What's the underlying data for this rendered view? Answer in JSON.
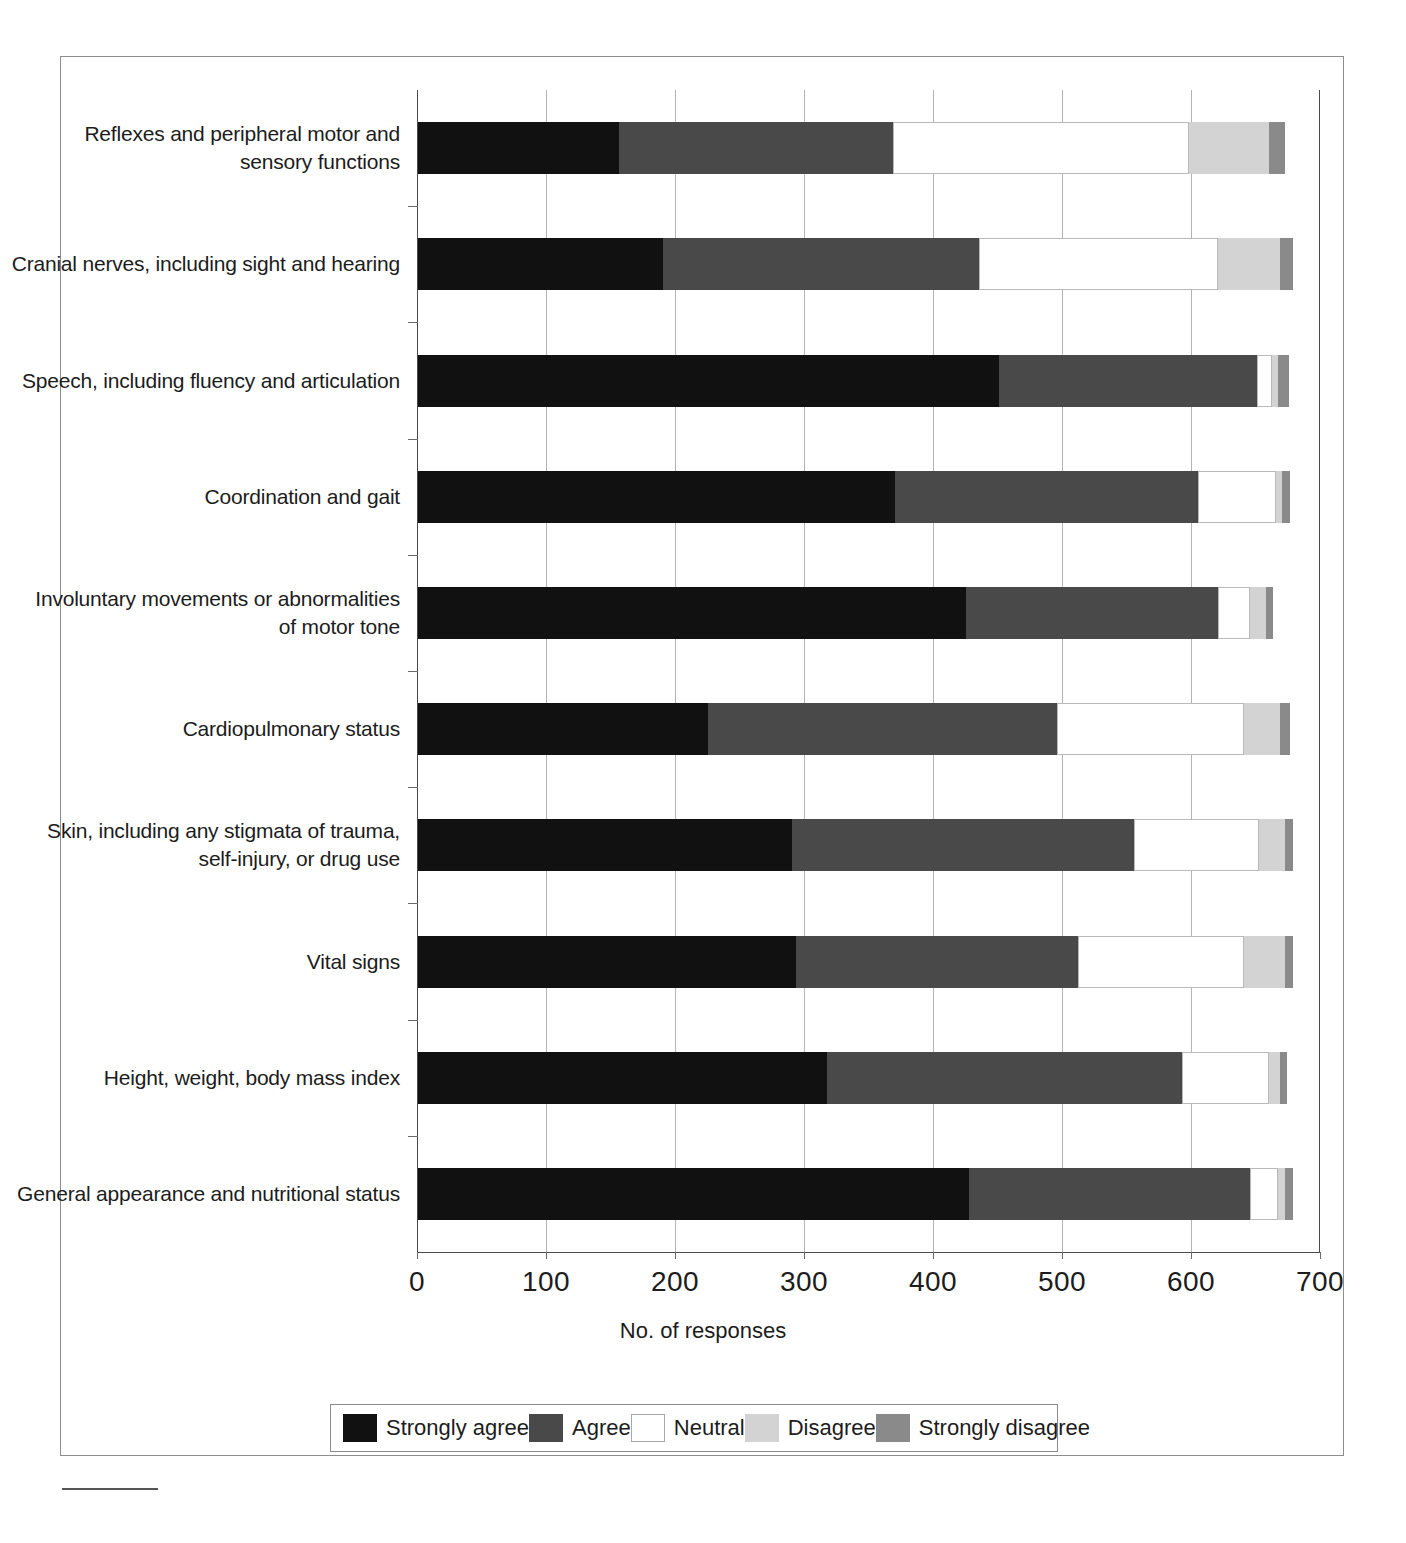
{
  "chart_data": {
    "type": "bar",
    "subtype": "stacked-horizontal-likert",
    "title": "",
    "xlabel": "No. of responses",
    "ylabel": "",
    "xlim": [
      0,
      700
    ],
    "xticks": [
      0,
      100,
      200,
      300,
      400,
      500,
      600,
      700
    ],
    "xtick_labels": [
      "0",
      "100",
      "200",
      "300",
      "400",
      "500",
      "600",
      "700"
    ],
    "grid": true,
    "grid_axis": "x",
    "legend_position": "bottom",
    "categories": [
      "Reflexes and peripheral motor and\nsensory functions",
      "Cranial nerves, including sight and hearing",
      "Speech, including fluency and articulation",
      "Coordination and gait",
      "Involuntary movements or abnormalities\nof motor tone",
      "Cardiopulmonary status",
      "Skin, including any stigmata of trauma,\nself-injury, or drug use",
      "Vital signs",
      "Height, weight, body mass index",
      "General appearance and nutritional status"
    ],
    "series": [
      {
        "name": "Strongly agree",
        "color": "#111111",
        "values": [
          156,
          190,
          450,
          370,
          425,
          225,
          290,
          293,
          317,
          427
        ]
      },
      {
        "name": "Agree",
        "color": "#494949",
        "values": [
          212,
          245,
          200,
          235,
          195,
          270,
          265,
          219,
          275,
          218
        ]
      },
      {
        "name": "Neutral",
        "color": "#ffffff",
        "values": [
          230,
          185,
          12,
          60,
          25,
          145,
          97,
          128,
          68,
          22
        ]
      },
      {
        "name": "Disagree",
        "color": "#d3d3d3",
        "values": [
          62,
          48,
          5,
          5,
          12,
          28,
          20,
          32,
          8,
          5
        ]
      },
      {
        "name": "Strongly disagree",
        "color": "#8a8a8a",
        "values": [
          12,
          10,
          8,
          6,
          6,
          8,
          6,
          6,
          6,
          6
        ]
      }
    ],
    "totals": [
      672,
      678,
      675,
      676,
      663,
      676,
      678,
      678,
      674,
      678
    ]
  },
  "legend": {
    "items": [
      {
        "label": "Strongly agree",
        "swatch": "sa"
      },
      {
        "label": "Agree",
        "swatch": "ag"
      },
      {
        "label": "Neutral",
        "swatch": "nt"
      },
      {
        "label": "Disagree",
        "swatch": "dg"
      },
      {
        "label": "Strongly disagree",
        "swatch": "sd"
      }
    ]
  },
  "colors": {
    "strongly_agree": "#111111",
    "agree": "#494949",
    "neutral": "#ffffff",
    "disagree": "#d3d3d3",
    "strongly_disagree": "#8a8a8a",
    "axis": "#4a4a4a",
    "grid": "#b4b4b4",
    "frame": "#8d8d8d"
  }
}
